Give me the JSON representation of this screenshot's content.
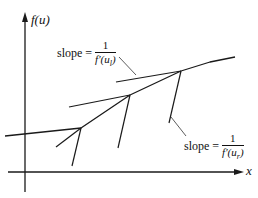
{
  "diagram": {
    "axes": {
      "y_label": "f(u)",
      "x_label": "x"
    },
    "annotations": {
      "slope_left": {
        "prefix": "slope =",
        "numerator": "1",
        "denominator": "f′(u_l)",
        "denominator_display": "f′(u",
        "denominator_sub": "l",
        "denominator_close": ")"
      },
      "slope_right": {
        "prefix": "slope =",
        "numerator": "1",
        "denominator": "f′(u_r)",
        "denominator_display": "f′(u",
        "denominator_sub": "r",
        "denominator_close": ")"
      }
    },
    "colors": {
      "line": "#1a1a1a",
      "background": "#ffffff"
    }
  }
}
